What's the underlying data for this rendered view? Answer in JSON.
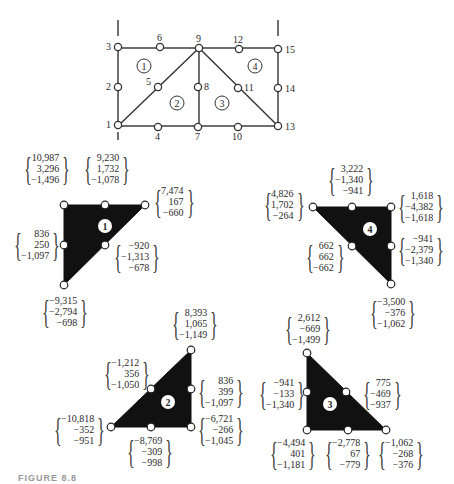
{
  "mesh": {
    "nodes": [
      {
        "id": "1",
        "x": 118,
        "y": 125
      },
      {
        "id": "2",
        "x": 118,
        "y": 87
      },
      {
        "id": "3",
        "x": 118,
        "y": 47
      },
      {
        "id": "4",
        "x": 158,
        "y": 127
      },
      {
        "id": "5",
        "x": 158,
        "y": 87
      },
      {
        "id": "6",
        "x": 160,
        "y": 47
      },
      {
        "id": "7",
        "x": 198,
        "y": 127
      },
      {
        "id": "8",
        "x": 198,
        "y": 87
      },
      {
        "id": "9",
        "x": 199,
        "y": 48
      },
      {
        "id": "10",
        "x": 238,
        "y": 127
      },
      {
        "id": "11",
        "x": 238,
        "y": 88
      },
      {
        "id": "12",
        "x": 239,
        "y": 49
      },
      {
        "id": "13",
        "x": 278,
        "y": 126
      },
      {
        "id": "14",
        "x": 278,
        "y": 88
      },
      {
        "id": "15",
        "x": 278,
        "y": 49
      }
    ],
    "elements": [
      {
        "id": "1",
        "x": 144,
        "y": 66
      },
      {
        "id": "2",
        "x": 177,
        "y": 103
      },
      {
        "id": "3",
        "x": 222,
        "y": 103
      },
      {
        "id": "4",
        "x": 255,
        "y": 66
      }
    ]
  },
  "elements": [
    {
      "id": "1",
      "vertices": [
        [
          64,
          205
        ],
        [
          145,
          205
        ],
        [
          64,
          285
        ]
      ],
      "label_pos": [
        105,
        226
      ],
      "node_points": [
        [
          64,
          205
        ],
        [
          105,
          205
        ],
        [
          145,
          205
        ],
        [
          64,
          245
        ],
        [
          105,
          245
        ],
        [
          64,
          285
        ]
      ],
      "force_vectors": [
        {
          "node": "top-left",
          "values": [
            "10,987",
            "3,296",
            "−1,496"
          ],
          "x": 22,
          "y": 152
        },
        {
          "node": "top-mid",
          "values": [
            "9,230",
            "1,732",
            "−1,078"
          ],
          "x": 82,
          "y": 152
        },
        {
          "node": "top-right",
          "values": [
            "7,474",
            "167",
            "−660"
          ],
          "x": 152,
          "y": 185
        },
        {
          "node": "left-mid",
          "values": [
            "836",
            "250",
            "−1,097"
          ],
          "x": 12,
          "y": 228
        },
        {
          "node": "hyp-mid",
          "values": [
            "−920",
            "−1,313",
            "−678"
          ],
          "x": 112,
          "y": 240
        },
        {
          "node": "bottom",
          "values": [
            "−9,315",
            "−2,794",
            "−698"
          ],
          "x": 40,
          "y": 295
        }
      ]
    },
    {
      "id": "4",
      "vertices": [
        [
          313,
          207
        ],
        [
          391,
          207
        ],
        [
          391,
          284
        ]
      ],
      "label_pos": [
        370,
        229
      ],
      "node_points": [
        [
          313,
          207
        ],
        [
          352,
          207
        ],
        [
          391,
          207
        ],
        [
          352,
          246
        ],
        [
          391,
          246
        ],
        [
          391,
          284
        ]
      ],
      "force_vectors": [
        {
          "node": "top-left",
          "values": [
            "4,826",
            "1,702",
            "−264"
          ],
          "x": 262,
          "y": 188
        },
        {
          "node": "top-mid",
          "values": [
            "3,222",
            "−1,340",
            "−941"
          ],
          "x": 326,
          "y": 163
        },
        {
          "node": "top-right",
          "values": [
            "1,618",
            "−4,382",
            "−1,618"
          ],
          "x": 396,
          "y": 190
        },
        {
          "node": "hyp-mid",
          "values": [
            "662",
            "662",
            "−662"
          ],
          "x": 304,
          "y": 240
        },
        {
          "node": "right-mid",
          "values": [
            "−941",
            "−2,379",
            "−1,340"
          ],
          "x": 396,
          "y": 233
        },
        {
          "node": "bottom",
          "values": [
            "−3,500",
            "−376",
            "−1,062"
          ],
          "x": 368,
          "y": 296
        }
      ]
    },
    {
      "id": "2",
      "vertices": [
        [
          111,
          427
        ],
        [
          191,
          427
        ],
        [
          191,
          350
        ]
      ],
      "label_pos": [
        168,
        402
      ],
      "node_points": [
        [
          111,
          427
        ],
        [
          151,
          427
        ],
        [
          191,
          427
        ],
        [
          151,
          389
        ],
        [
          191,
          389
        ],
        [
          191,
          350
        ]
      ],
      "force_vectors": [
        {
          "node": "top",
          "values": [
            "8,393",
            "1,065",
            "−1,149"
          ],
          "x": 170,
          "y": 307
        },
        {
          "node": "hyp-mid",
          "values": [
            "−1,212",
            "356",
            "−1,050"
          ],
          "x": 102,
          "y": 357
        },
        {
          "node": "right-mid",
          "values": [
            "836",
            "399",
            "−1,097"
          ],
          "x": 196,
          "y": 375
        },
        {
          "node": "bottom-left",
          "values": [
            "−10,818",
            "−352",
            "−951"
          ],
          "x": 52,
          "y": 413
        },
        {
          "node": "bottom-mid",
          "values": [
            "−8,769",
            "−309",
            "−998"
          ],
          "x": 125,
          "y": 435
        },
        {
          "node": "bottom-right",
          "values": [
            "−6,721",
            "−266",
            "−1,045"
          ],
          "x": 196,
          "y": 413
        }
      ]
    },
    {
      "id": "3",
      "vertices": [
        [
          307,
          353
        ],
        [
          307,
          430
        ],
        [
          386,
          430
        ]
      ],
      "label_pos": [
        330,
        404
      ],
      "node_points": [
        [
          307,
          353
        ],
        [
          307,
          392
        ],
        [
          346,
          392
        ],
        [
          307,
          430
        ],
        [
          348,
          430
        ],
        [
          386,
          430
        ]
      ],
      "force_vectors": [
        {
          "node": "top",
          "values": [
            "2,612",
            "−669",
            "−1,499"
          ],
          "x": 283,
          "y": 312
        },
        {
          "node": "left-mid",
          "values": [
            "−941",
            "−133",
            "−1,340"
          ],
          "x": 257,
          "y": 377
        },
        {
          "node": "hyp-mid",
          "values": [
            "775",
            "−469",
            "−937"
          ],
          "x": 361,
          "y": 377
        },
        {
          "node": "bottom-left",
          "values": [
            "−4,494",
            "401",
            "−1,181"
          ],
          "x": 268,
          "y": 437
        },
        {
          "node": "bottom-mid",
          "values": [
            "−2,778",
            "67",
            "−779"
          ],
          "x": 323,
          "y": 437
        },
        {
          "node": "bottom-right",
          "values": [
            "−1,062",
            "−268",
            "−376"
          ],
          "x": 376,
          "y": 437
        }
      ]
    }
  ],
  "caption": {
    "text": "FIGURE 8.8"
  }
}
